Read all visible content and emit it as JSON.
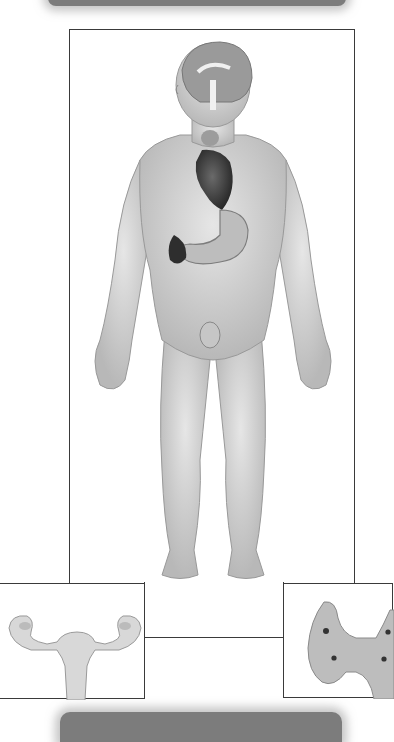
{
  "figure": {
    "main_figure": "Male human body, front view, with internal organs shown",
    "organs_shown": [
      "brain (pituitary / hypothalamus)",
      "thyroid",
      "heart",
      "stomach",
      "pancreas",
      "spleen/adrenal",
      "testes"
    ],
    "insets": {
      "left": "Female reproductive organs (uterus and ovaries)",
      "right": "Thyroid gland (with parathyroid glands)"
    }
  },
  "colors": {
    "frame_border": "#3a3a3a",
    "header_bar": "#7c7c7c",
    "background": "#ffffff",
    "skin": "#d8d8d8"
  }
}
